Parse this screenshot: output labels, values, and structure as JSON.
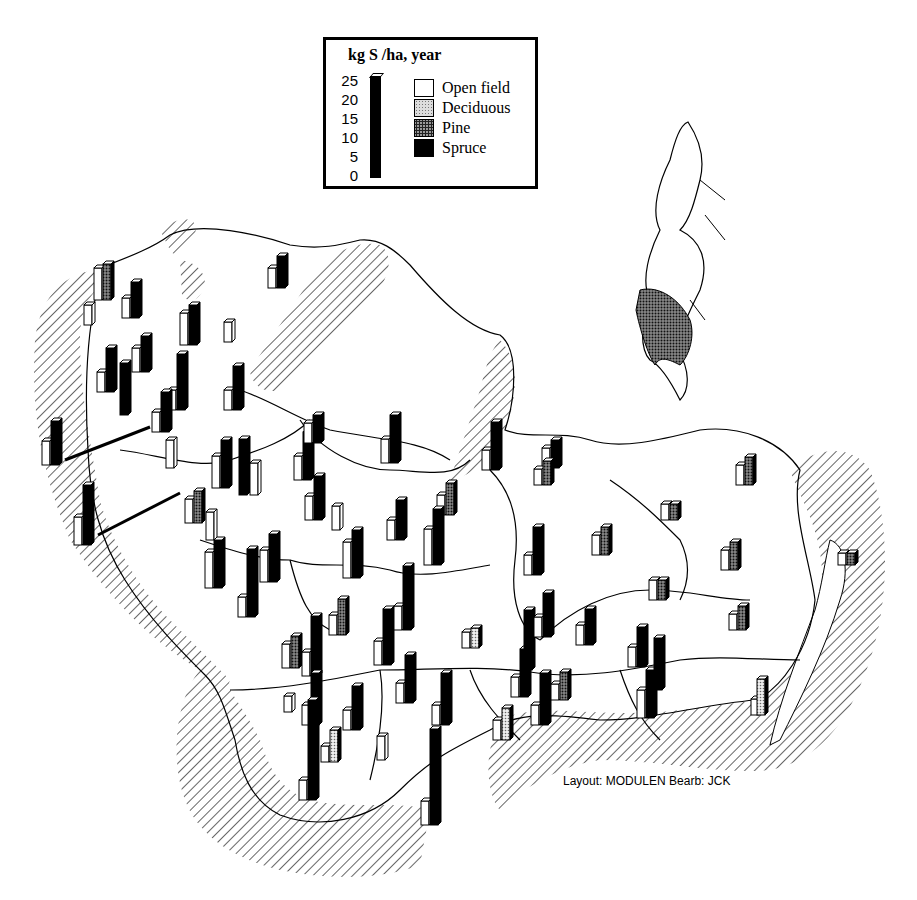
{
  "legend": {
    "title": "kg S /ha, year",
    "axis_ticks": [
      "25",
      "20",
      "15",
      "10",
      "5",
      "0"
    ],
    "items": [
      {
        "label": "Open field",
        "pattern": "white"
      },
      {
        "label": "Deciduous",
        "pattern": "light-stipple"
      },
      {
        "label": "Pine",
        "pattern": "dark-stipple"
      },
      {
        "label": "Spruce",
        "pattern": "black"
      }
    ],
    "scale_bar_value": 25
  },
  "credit": "Layout: MODULEN Bearb: JCK",
  "inset_map": {
    "subject": "Sweden",
    "highlighted_region": "southern Sweden (shaded)"
  },
  "colors": {
    "ink": "#000000",
    "paper": "#ffffff",
    "deciduous": "#cccccc",
    "pine": "#555555",
    "spruce": "#000000"
  },
  "chart_data": {
    "type": "bar",
    "ylabel": "kg S /ha, year",
    "ylim": [
      0,
      25
    ],
    "series_names": [
      "Open field",
      "Deciduous",
      "Pine",
      "Spruce"
    ],
    "sites": [
      {
        "x": 100,
        "y": 300,
        "open": 8,
        "deciduous": 0,
        "pine": 9,
        "spruce": 0
      },
      {
        "x": 90,
        "y": 325,
        "open": 5,
        "deciduous": 0,
        "pine": 0,
        "spruce": 0
      },
      {
        "x": 128,
        "y": 318,
        "open": 5,
        "deciduous": 0,
        "pine": 0,
        "spruce": 9
      },
      {
        "x": 186,
        "y": 345,
        "open": 8,
        "deciduous": 0,
        "pine": 0,
        "spruce": 10
      },
      {
        "x": 274,
        "y": 288,
        "open": 5,
        "deciduous": 0,
        "pine": 0,
        "spruce": 8
      },
      {
        "x": 230,
        "y": 342,
        "open": 5,
        "deciduous": 0,
        "pine": 0,
        "spruce": 0
      },
      {
        "x": 103,
        "y": 392,
        "open": 5,
        "deciduous": 0,
        "pine": 0,
        "spruce": 11
      },
      {
        "x": 138,
        "y": 372,
        "open": 6,
        "deciduous": 0,
        "pine": 0,
        "spruce": 9
      },
      {
        "x": 126,
        "y": 415,
        "open": 0,
        "deciduous": 0,
        "pine": 0,
        "spruce": 13
      },
      {
        "x": 174,
        "y": 410,
        "open": 5,
        "deciduous": 0,
        "pine": 0,
        "spruce": 14
      },
      {
        "x": 158,
        "y": 432,
        "open": 5,
        "deciduous": 0,
        "pine": 0,
        "spruce": 10
      },
      {
        "x": 230,
        "y": 410,
        "open": 5,
        "deciduous": 0,
        "pine": 0,
        "spruce": 11
      },
      {
        "x": 48,
        "y": 465,
        "open": 6,
        "deciduous": 0,
        "pine": 0,
        "spruce": 11
      },
      {
        "x": 172,
        "y": 468,
        "open": 7,
        "deciduous": 0,
        "pine": 0,
        "spruce": 0
      },
      {
        "x": 80,
        "y": 545,
        "open": 7,
        "deciduous": 0,
        "pine": 0,
        "spruce": 15
      },
      {
        "x": 218,
        "y": 488,
        "open": 8,
        "deciduous": 0,
        "pine": 0,
        "spruce": 12
      },
      {
        "x": 245,
        "y": 495,
        "open": 0,
        "deciduous": 0,
        "pine": 0,
        "spruce": 14
      },
      {
        "x": 256,
        "y": 495,
        "open": 8,
        "deciduous": 0,
        "pine": 0,
        "spruce": 0
      },
      {
        "x": 191,
        "y": 523,
        "open": 6,
        "deciduous": 0,
        "pine": 8,
        "spruce": 0
      },
      {
        "x": 212,
        "y": 540,
        "open": 7,
        "deciduous": 0,
        "pine": 0,
        "spruce": 0
      },
      {
        "x": 300,
        "y": 480,
        "open": 6,
        "deciduous": 0,
        "pine": 0,
        "spruce": 12
      },
      {
        "x": 310,
        "y": 443,
        "open": 5,
        "deciduous": 0,
        "pine": 0,
        "spruce": 7
      },
      {
        "x": 311,
        "y": 520,
        "open": 6,
        "deciduous": 0,
        "pine": 0,
        "spruce": 11
      },
      {
        "x": 338,
        "y": 530,
        "open": 6,
        "deciduous": 0,
        "pine": 0,
        "spruce": 0
      },
      {
        "x": 387,
        "y": 463,
        "open": 6,
        "deciduous": 0,
        "pine": 0,
        "spruce": 12
      },
      {
        "x": 488,
        "y": 470,
        "open": 5,
        "deciduous": 0,
        "pine": 0,
        "spruce": 12
      },
      {
        "x": 548,
        "y": 468,
        "open": 5,
        "deciduous": 0,
        "pine": 0,
        "spruce": 7
      },
      {
        "x": 443,
        "y": 515,
        "open": 5,
        "deciduous": 0,
        "pine": 8,
        "spruce": 0
      },
      {
        "x": 393,
        "y": 540,
        "open": 5,
        "deciduous": 0,
        "pine": 0,
        "spruce": 10
      },
      {
        "x": 349,
        "y": 578,
        "open": 9,
        "deciduous": 0,
        "pine": 0,
        "spruce": 12
      },
      {
        "x": 430,
        "y": 565,
        "open": 9,
        "deciduous": 0,
        "pine": 0,
        "spruce": 14
      },
      {
        "x": 211,
        "y": 588,
        "open": 9,
        "deciduous": 0,
        "pine": 0,
        "spruce": 12
      },
      {
        "x": 266,
        "y": 582,
        "open": 8,
        "deciduous": 0,
        "pine": 0,
        "spruce": 12
      },
      {
        "x": 244,
        "y": 617,
        "open": 5,
        "deciduous": 0,
        "pine": 0,
        "spruce": 17
      },
      {
        "x": 540,
        "y": 485,
        "open": 4,
        "deciduous": 0,
        "pine": 6,
        "spruce": 0
      },
      {
        "x": 530,
        "y": 575,
        "open": 5,
        "deciduous": 0,
        "pine": 0,
        "spruce": 12
      },
      {
        "x": 598,
        "y": 555,
        "open": 5,
        "deciduous": 0,
        "pine": 7,
        "spruce": 0
      },
      {
        "x": 742,
        "y": 485,
        "open": 5,
        "deciduous": 0,
        "pine": 7,
        "spruce": 0
      },
      {
        "x": 667,
        "y": 520,
        "open": 4,
        "deciduous": 0,
        "pine": 4,
        "spruce": 0
      },
      {
        "x": 727,
        "y": 570,
        "open": 5,
        "deciduous": 0,
        "pine": 7,
        "spruce": 0
      },
      {
        "x": 655,
        "y": 600,
        "open": 5,
        "deciduous": 0,
        "pine": 5,
        "spruce": 0
      },
      {
        "x": 735,
        "y": 630,
        "open": 4,
        "deciduous": 0,
        "pine": 6,
        "spruce": 0
      },
      {
        "x": 844,
        "y": 565,
        "open": 3,
        "deciduous": 0,
        "pine": 3,
        "spruce": 0
      },
      {
        "x": 757,
        "y": 715,
        "open": 4,
        "deciduous": 0,
        "pine": 0,
        "spruce": 0
      },
      {
        "x": 763,
        "y": 715,
        "open": 0,
        "deciduous": 9,
        "pine": 0,
        "spruce": 0
      },
      {
        "x": 288,
        "y": 668,
        "open": 6,
        "deciduous": 0,
        "pine": 8,
        "spruce": 0
      },
      {
        "x": 335,
        "y": 635,
        "open": 5,
        "deciduous": 0,
        "pine": 9,
        "spruce": 0
      },
      {
        "x": 380,
        "y": 665,
        "open": 6,
        "deciduous": 0,
        "pine": 0,
        "spruce": 14
      },
      {
        "x": 400,
        "y": 630,
        "open": 6,
        "deciduous": 0,
        "pine": 0,
        "spruce": 16
      },
      {
        "x": 468,
        "y": 648,
        "open": 4,
        "deciduous": 5,
        "pine": 0,
        "spruce": 0
      },
      {
        "x": 308,
        "y": 676,
        "open": 6,
        "deciduous": 0,
        "pine": 0,
        "spruce": 15
      },
      {
        "x": 290,
        "y": 712,
        "open": 4,
        "deciduous": 0,
        "pine": 0,
        "spruce": 0
      },
      {
        "x": 308,
        "y": 725,
        "open": 5,
        "deciduous": 0,
        "pine": 0,
        "spruce": 13
      },
      {
        "x": 349,
        "y": 730,
        "open": 5,
        "deciduous": 0,
        "pine": 0,
        "spruce": 11
      },
      {
        "x": 402,
        "y": 703,
        "open": 5,
        "deciduous": 0,
        "pine": 0,
        "spruce": 12
      },
      {
        "x": 438,
        "y": 725,
        "open": 5,
        "deciduous": 0,
        "pine": 0,
        "spruce": 13
      },
      {
        "x": 327,
        "y": 762,
        "open": 4,
        "deciduous": 8,
        "pine": 0,
        "spruce": 0
      },
      {
        "x": 383,
        "y": 760,
        "open": 6,
        "deciduous": 0,
        "pine": 0,
        "spruce": 0
      },
      {
        "x": 305,
        "y": 800,
        "open": 5,
        "deciduous": 0,
        "pine": 0,
        "spruce": 25
      },
      {
        "x": 427,
        "y": 825,
        "open": 6,
        "deciduous": 0,
        "pine": 0,
        "spruce": 24
      },
      {
        "x": 499,
        "y": 740,
        "open": 5,
        "deciduous": 8,
        "pine": 0,
        "spruce": 0
      },
      {
        "x": 517,
        "y": 697,
        "open": 5,
        "deciduous": 0,
        "pine": 0,
        "spruce": 12
      },
      {
        "x": 530,
        "y": 670,
        "open": 0,
        "deciduous": 0,
        "pine": 0,
        "spruce": 15
      },
      {
        "x": 537,
        "y": 725,
        "open": 5,
        "deciduous": 0,
        "pine": 0,
        "spruce": 13
      },
      {
        "x": 540,
        "y": 637,
        "open": 5,
        "deciduous": 0,
        "pine": 0,
        "spruce": 11
      },
      {
        "x": 557,
        "y": 700,
        "open": 4,
        "deciduous": 0,
        "pine": 7,
        "spruce": 0
      },
      {
        "x": 582,
        "y": 645,
        "open": 5,
        "deciduous": 0,
        "pine": 0,
        "spruce": 9
      },
      {
        "x": 634,
        "y": 667,
        "open": 5,
        "deciduous": 0,
        "pine": 0,
        "spruce": 10
      },
      {
        "x": 643,
        "y": 718,
        "open": 7,
        "deciduous": 0,
        "pine": 0,
        "spruce": 12
      },
      {
        "x": 660,
        "y": 690,
        "open": 0,
        "deciduous": 0,
        "pine": 0,
        "spruce": 13
      }
    ]
  }
}
